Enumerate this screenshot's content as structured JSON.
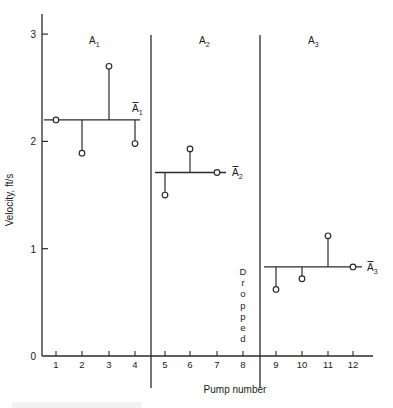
{
  "chart_data": {
    "type": "scatter",
    "title": "",
    "xlabel": "Pump number",
    "ylabel": "Velocity, ft/s",
    "ylim": [
      0,
      3
    ],
    "yticks": [
      0,
      1,
      2,
      3
    ],
    "xticks": [
      1,
      2,
      3,
      4,
      5,
      6,
      7,
      8,
      9,
      10,
      11,
      12
    ],
    "grid": false,
    "groups": [
      {
        "name": "A1",
        "mean_label": "Ā1",
        "mean": 2.2,
        "pumps": [
          1,
          2,
          3,
          4
        ],
        "values": [
          2.2,
          1.89,
          2.7,
          1.98
        ]
      },
      {
        "name": "A2",
        "mean_label": "Ā2",
        "mean": 1.71,
        "pumps": [
          5,
          6,
          7
        ],
        "values": [
          1.5,
          1.93,
          1.71
        ]
      },
      {
        "name": "A3",
        "mean_label": "Ā3",
        "mean": 0.83,
        "pumps": [
          9,
          10,
          11,
          12
        ],
        "values": [
          0.62,
          0.72,
          1.12,
          0.83
        ]
      }
    ],
    "annotations": [
      {
        "text": "Dropped",
        "at_pump": 8,
        "orientation": "vertical-stacked"
      }
    ]
  },
  "labels": {
    "xlabel": "Pump number",
    "ylabel": "Velocity, ft/s",
    "dropped": "Dropped",
    "caption_partial": "Figure — Pump velocity variation between groups"
  }
}
